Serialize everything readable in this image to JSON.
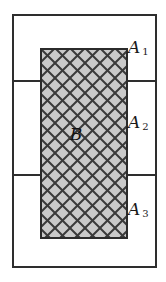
{
  "figure": {
    "outer_rect": {
      "name": "sample-space-rectangle",
      "x": 12,
      "y": 14,
      "width": 145,
      "height": 254,
      "stroke": "#2e2e2e",
      "stroke_width": 2,
      "fill": "none"
    },
    "dividers": [
      {
        "name": "divider-1",
        "y": 80,
        "x1": 12,
        "x2": 157,
        "stroke": "#2e2e2e"
      },
      {
        "name": "divider-2",
        "y": 174,
        "x1": 12,
        "x2": 157,
        "stroke": "#2e2e2e"
      }
    ],
    "hatched_rect": {
      "name": "event-b-rectangle",
      "x": 40,
      "y": 48,
      "width": 88,
      "height": 191,
      "fill": "#c9c9c9",
      "stroke": "#2b2b2b",
      "stroke_width": 2,
      "hatch": {
        "pattern": "cross-hatch",
        "spacing": 15,
        "line_color": "#3a3a3a",
        "line_width": 2,
        "angles": [
          45,
          -45
        ]
      }
    },
    "labels": {
      "a1": {
        "text": "A",
        "subscript": "1"
      },
      "a2": {
        "text": "A",
        "subscript": "2"
      },
      "a3": {
        "text": "A",
        "subscript": "3"
      },
      "b": {
        "text": "B"
      }
    },
    "colors": {
      "background": "#ffffff",
      "line": "#2e2e2e",
      "hatch_fill": "#c9c9c9",
      "hatch_line": "#3a3a3a",
      "text": "#1a1a1a"
    }
  }
}
